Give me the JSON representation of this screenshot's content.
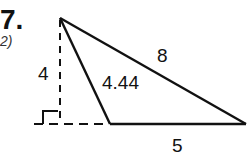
{
  "problem": {
    "number": "7.",
    "subtitle": "2)"
  },
  "diagram": {
    "labels": {
      "height": "4",
      "side_inner": "4.44",
      "side_long": "8",
      "base": "5"
    },
    "colors": {
      "stroke": "#111111",
      "background": "#ffffff"
    }
  }
}
